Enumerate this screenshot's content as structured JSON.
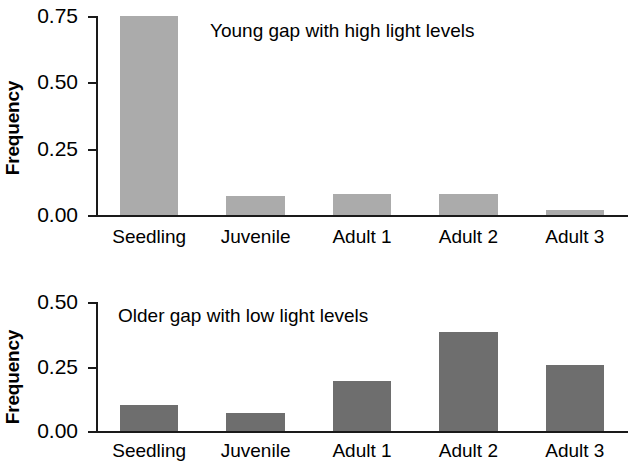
{
  "chart_data": [
    {
      "type": "bar",
      "panel": "top",
      "title": "Young gap with high light levels",
      "xlabel": "",
      "ylabel": "Frequency",
      "categories": [
        "Seedling",
        "Juvenile",
        "Adult 1",
        "Adult 2",
        "Adult 3"
      ],
      "values": [
        0.75,
        0.07,
        0.08,
        0.08,
        0.02
      ],
      "ylim": [
        0.0,
        0.75
      ],
      "yticks": [
        0.0,
        0.25,
        0.5,
        0.75
      ],
      "ytick_labels": [
        "0.00",
        "0.25",
        "0.50",
        "0.75"
      ],
      "grid": false,
      "legend": "none",
      "bar_color": "#ababab"
    },
    {
      "type": "bar",
      "panel": "bottom",
      "title": "Older gap with low light levels",
      "xlabel": "",
      "ylabel": "Frequency",
      "categories": [
        "Seedling",
        "Juvenile",
        "Adult 1",
        "Adult 2",
        "Adult 3"
      ],
      "values": [
        0.1,
        0.07,
        0.195,
        0.385,
        0.255
      ],
      "ylim": [
        0.0,
        0.5
      ],
      "yticks": [
        0.0,
        0.25,
        0.5
      ],
      "ytick_labels": [
        "0.00",
        "0.25",
        "0.50"
      ],
      "grid": false,
      "legend": "none",
      "bar_color": "#6e6e6e"
    }
  ],
  "colors": {
    "axis": "#1a1a1a",
    "text": "#000000",
    "background": "#ffffff",
    "bar_light": "#ababab",
    "bar_dark": "#6e6e6e"
  }
}
